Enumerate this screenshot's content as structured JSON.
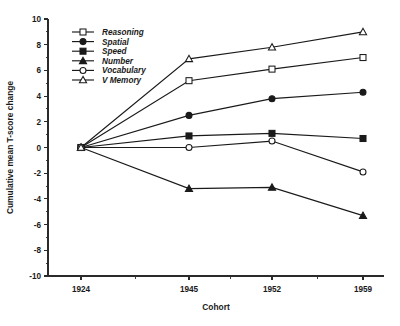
{
  "chart_data": {
    "type": "line",
    "title": "",
    "xlabel": "Cohort",
    "ylabel": "Cumulative mean T-score change",
    "categories": [
      "1924",
      "1945",
      "1952",
      "1959"
    ],
    "x": [
      1924,
      1945,
      1952,
      1959
    ],
    "ylim": [
      -10,
      10
    ],
    "ytick_labels": [
      "10",
      "8",
      "6",
      "4",
      "2",
      "0",
      "-2",
      "-4",
      "-6",
      "-8",
      "-10"
    ],
    "ytick_values": [
      10,
      8,
      6,
      4,
      2,
      0,
      -2,
      -4,
      -6,
      -8,
      -10
    ],
    "xtick_labels": [
      "1924",
      "1945",
      "1952",
      "1959"
    ],
    "grid": false,
    "legend_position": "upper-left-inside",
    "series": [
      {
        "name": "Reasoning",
        "marker": "open-square",
        "values": [
          0.0,
          5.2,
          6.1,
          7.0
        ]
      },
      {
        "name": "Spatial",
        "marker": "filled-circle",
        "values": [
          0.0,
          2.5,
          3.8,
          4.3
        ]
      },
      {
        "name": "Speed",
        "marker": "filled-square",
        "values": [
          0.0,
          0.9,
          1.1,
          0.7
        ]
      },
      {
        "name": "Number",
        "marker": "filled-triangle",
        "values": [
          0.0,
          -3.2,
          -3.1,
          -5.3
        ]
      },
      {
        "name": "Vocabulary",
        "marker": "open-circle",
        "values": [
          0.0,
          0.0,
          0.5,
          -1.9
        ]
      },
      {
        "name": "V Memory",
        "marker": "open-triangle",
        "values": [
          0.0,
          6.9,
          7.8,
          9.0
        ]
      }
    ],
    "colors": {
      "line": "#1a1a1a",
      "axis": "#2a2a2a",
      "background": "#ffffff"
    }
  }
}
